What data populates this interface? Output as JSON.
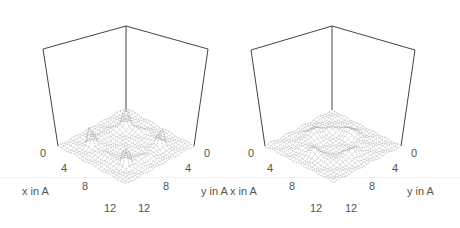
{
  "chart_data": [
    {
      "type": "surface3d",
      "panel": "left",
      "title": "",
      "xlabel": "x in A",
      "ylabel": "y in A",
      "zlabel": "",
      "x_ticks": [
        "0",
        "4",
        "8",
        "12"
      ],
      "y_ticks": [
        "0",
        "4",
        "8",
        "12"
      ],
      "xlim": [
        0,
        14
      ],
      "ylim": [
        0,
        14
      ],
      "grid": false,
      "description": "Wireframe surface with a ring-shaped ridge and four sharp peaks near the corners of the ring"
    },
    {
      "type": "surface3d",
      "panel": "right",
      "title": "",
      "xlabel": "x in A",
      "ylabel": "y in A",
      "zlabel": "",
      "x_ticks": [
        "0",
        "4",
        "8",
        "12"
      ],
      "y_ticks": [
        "0",
        "4",
        "8",
        "12"
      ],
      "xlim": [
        0,
        14
      ],
      "ylim": [
        0,
        14
      ],
      "grid": false,
      "description": "Wireframe surface with a low ring-shaped ridge and broad bumps, no sharp peaks"
    }
  ],
  "panels": [
    {
      "x_label": "x in A",
      "y_label": "y in A",
      "x_ticks": [
        "0",
        "4",
        "8",
        "12"
      ],
      "y_ticks": [
        "0",
        "4",
        "8",
        "12"
      ]
    },
    {
      "x_label": "x in A",
      "y_label": "y in A",
      "x_ticks": [
        "0",
        "4",
        "8",
        "12"
      ],
      "y_ticks": [
        "0",
        "4",
        "8",
        "12"
      ]
    }
  ],
  "colors": {
    "box": "#444444",
    "mesh": "#9a9a9a",
    "text": "#555555"
  }
}
